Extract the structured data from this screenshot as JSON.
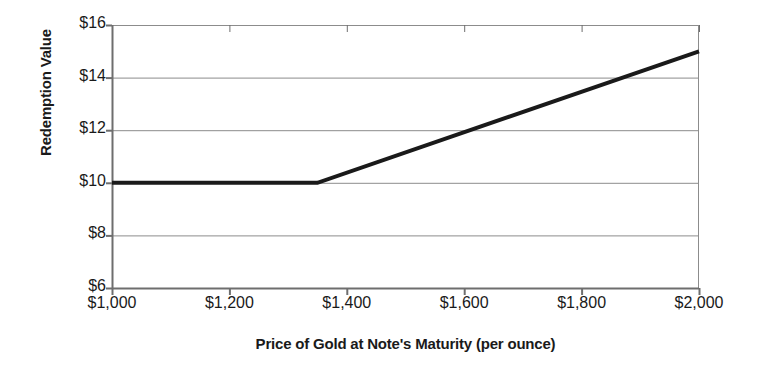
{
  "chart_data": {
    "type": "line",
    "title": "",
    "xlabel": "Price of Gold at Note's Maturity (per ounce)",
    "ylabel": "Redemption Value",
    "xlim": [
      1000,
      2000
    ],
    "ylim": [
      6,
      16
    ],
    "grid": true,
    "legend": false,
    "xticks": [
      1000,
      1200,
      1400,
      1600,
      1800,
      2000
    ],
    "xticklabels": [
      "$1,000",
      "$1,200",
      "$1,400",
      "$1,600",
      "$1,800",
      "$2,000"
    ],
    "yticks": [
      6,
      8,
      10,
      12,
      14,
      16
    ],
    "yticklabels": [
      "$6",
      "$8",
      "$10",
      "$12",
      "$14",
      "$16"
    ],
    "series": [
      {
        "name": "Redemption Value",
        "color": "#1a1a1a",
        "linewidth": 4,
        "x": [
          1000,
          1350,
          2000
        ],
        "values": [
          10,
          10,
          15
        ]
      }
    ],
    "annotations": []
  },
  "axes": {
    "y_title": "Redemption Value",
    "x_title": "Price of Gold at Note's Maturity (per ounce)"
  },
  "style": {
    "grid_color": "#8c8c8c",
    "axis_color": "#6e6e6e",
    "line_color": "#1a1a1a",
    "background": "#ffffff"
  }
}
